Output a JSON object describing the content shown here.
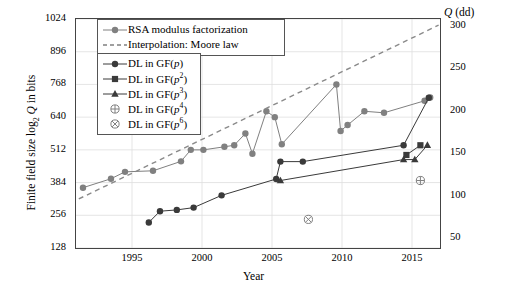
{
  "axes": {
    "ylabel": "Finite field size log2 Q in bits",
    "xlabel": "Year",
    "right_label": "Q (dd)",
    "yticks": [
      "128",
      "256",
      "384",
      "512",
      "640",
      "768",
      "896",
      "1024"
    ],
    "right_ticks": [
      "50",
      "100",
      "150",
      "200",
      "250",
      "300"
    ],
    "xticks": [
      "1995",
      "2000",
      "2005",
      "2010",
      "2015"
    ]
  },
  "legend": {
    "box_top": [
      {
        "label": "RSA modulus factorization",
        "marker": "circle",
        "style": "solid",
        "color": "#808080"
      },
      {
        "label": "Interpolation: Moore law",
        "marker": "none",
        "style": "dashed",
        "color": "#808080"
      }
    ],
    "box_bottom": [
      {
        "label": "DL in GF(p)",
        "marker": "circle",
        "style": "solid",
        "color": "#3a3a3a"
      },
      {
        "label": "DL in GF(p^2)",
        "marker": "square",
        "style": "solid",
        "color": "#3a3a3a"
      },
      {
        "label": "DL in GF(p^3)",
        "marker": "triangle",
        "style": "solid",
        "color": "#3a3a3a"
      },
      {
        "label": "DL in GF(p^4)",
        "marker": "circled-plus",
        "style": "none",
        "color": "#808080"
      },
      {
        "label": "DL in GF(p^6)",
        "marker": "circled-times",
        "style": "none",
        "color": "#808080"
      }
    ]
  },
  "chart_data": {
    "type": "line",
    "title": "",
    "xlabel": "Year",
    "ylabel": "Finite field size log2 Q in bits",
    "y2label": "Q (dd)",
    "xlim": [
      1991,
      2017
    ],
    "ylim": [
      128,
      1024
    ],
    "y2lim": [
      38.5,
      308.2
    ],
    "grid": true,
    "legend_position": "top-left",
    "series": [
      {
        "name": "RSA modulus factorization",
        "marker": "circle",
        "color": "#808080",
        "style": "solid",
        "points": [
          {
            "x": 1991.5,
            "y": 364
          },
          {
            "x": 1993.5,
            "y": 399
          },
          {
            "x": 1994.5,
            "y": 426
          },
          {
            "x": 1996.5,
            "y": 430
          },
          {
            "x": 1998.5,
            "y": 467
          },
          {
            "x": 1999.2,
            "y": 512
          },
          {
            "x": 2000.1,
            "y": 512
          },
          {
            "x": 2001.6,
            "y": 524
          },
          {
            "x": 2002.3,
            "y": 530
          },
          {
            "x": 2003.1,
            "y": 576
          },
          {
            "x": 2003.6,
            "y": 497
          },
          {
            "x": 2004.6,
            "y": 663
          },
          {
            "x": 2005.2,
            "y": 640
          },
          {
            "x": 2005.7,
            "y": 534
          },
          {
            "x": 2009.6,
            "y": 768
          },
          {
            "x": 2009.9,
            "y": 586
          },
          {
            "x": 2010.4,
            "y": 609
          },
          {
            "x": 2011.6,
            "y": 663
          },
          {
            "x": 2013.0,
            "y": 657
          },
          {
            "x": 2015.9,
            "y": 704
          },
          {
            "x": 2016.3,
            "y": 717
          }
        ]
      },
      {
        "name": "Interpolation: Moore law",
        "marker": "none",
        "color": "#8a8a8a",
        "style": "dashed",
        "points": [
          {
            "x": 1991.2,
            "y": 320
          },
          {
            "x": 2016.9,
            "y": 1000
          }
        ]
      },
      {
        "name": "DL in GF(p)",
        "marker": "circle",
        "color": "#3a3a3a",
        "style": "solid",
        "points": [
          {
            "x": 1996.2,
            "y": 228
          },
          {
            "x": 1997.0,
            "y": 272
          },
          {
            "x": 1998.2,
            "y": 277
          },
          {
            "x": 1999.4,
            "y": 286
          },
          {
            "x": 2001.4,
            "y": 334
          },
          {
            "x": 2005.3,
            "y": 398
          },
          {
            "x": 2005.6,
            "y": 466
          },
          {
            "x": 2007.2,
            "y": 466
          },
          {
            "x": 2014.4,
            "y": 530
          },
          {
            "x": 2016.2,
            "y": 716
          }
        ]
      },
      {
        "name": "DL in GF(p^2)",
        "marker": "square",
        "color": "#3a3a3a",
        "style": "solid",
        "points": [
          {
            "x": 2014.6,
            "y": 492
          },
          {
            "x": 2015.6,
            "y": 530
          }
        ]
      },
      {
        "name": "DL in GF(p^3)",
        "marker": "triangle",
        "color": "#3a3a3a",
        "style": "solid",
        "points": [
          {
            "x": 2005.6,
            "y": 392
          },
          {
            "x": 2014.4,
            "y": 474
          },
          {
            "x": 2015.2,
            "y": 474
          },
          {
            "x": 2016.1,
            "y": 530
          }
        ]
      },
      {
        "name": "DL in GF(p^4)",
        "marker": "circled-plus",
        "color": "#808080",
        "style": "none",
        "points": [
          {
            "x": 2015.6,
            "y": 392
          }
        ]
      },
      {
        "name": "DL in GF(p^6)",
        "marker": "circled-times",
        "color": "#808080",
        "style": "none",
        "points": [
          {
            "x": 2007.6,
            "y": 240
          }
        ]
      }
    ]
  }
}
